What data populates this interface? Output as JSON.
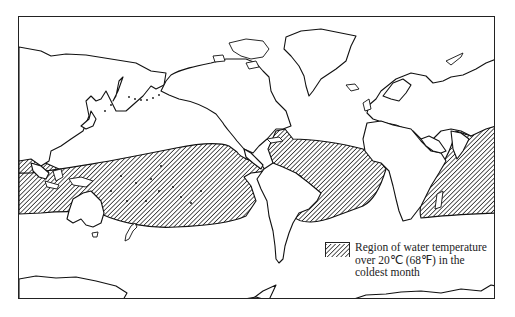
{
  "figure": {
    "type": "world-map",
    "projection": "Mercator-like, Pacific-centered left edge"
  },
  "legend": {
    "swatch_pattern": "diagonal-hatch",
    "lines": [
      "Region of water temperature",
      "over 20℃ (68℉) in the",
      "coldest month"
    ]
  },
  "colors": {
    "stroke": "#111111",
    "background": "#ffffff",
    "hatch": "#222222"
  }
}
